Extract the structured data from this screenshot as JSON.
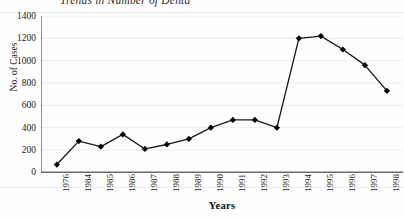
{
  "chart_data": {
    "type": "line",
    "title": "Trends in Number of Denta",
    "subtitle": "",
    "xlabel": "Years",
    "ylabel": "No. of Cases",
    "categories": [
      "1976",
      "1984",
      "1985",
      "1986",
      "1987",
      "1988",
      "1989",
      "1990",
      "1991",
      "1992",
      "1993",
      "1994",
      "1995",
      "1996",
      "1997",
      "1998"
    ],
    "values": [
      70,
      280,
      230,
      340,
      210,
      250,
      300,
      400,
      470,
      470,
      400,
      1200,
      1220,
      1100,
      960,
      730
    ],
    "ylim": [
      0,
      1400
    ],
    "ytick_labels": [
      "1400",
      "1200",
      "1000",
      "800",
      "600",
      "400",
      "200",
      "0"
    ],
    "ytick_values": [
      1400,
      1200,
      1000,
      800,
      600,
      400,
      200,
      0
    ],
    "grid": true,
    "legend": false,
    "legend_position": "none",
    "marker": "diamond",
    "series": [
      {
        "name": "No. of Cases",
        "values": [
          70,
          280,
          230,
          340,
          210,
          250,
          300,
          400,
          470,
          470,
          400,
          1200,
          1220,
          1100,
          960,
          730
        ]
      }
    ],
    "annotations": [],
    "colors": {
      "line": "#1a1a1a",
      "marker": "#000000",
      "axis": "#555555",
      "grid": "#eeeef2",
      "background": "#fefefe"
    }
  }
}
